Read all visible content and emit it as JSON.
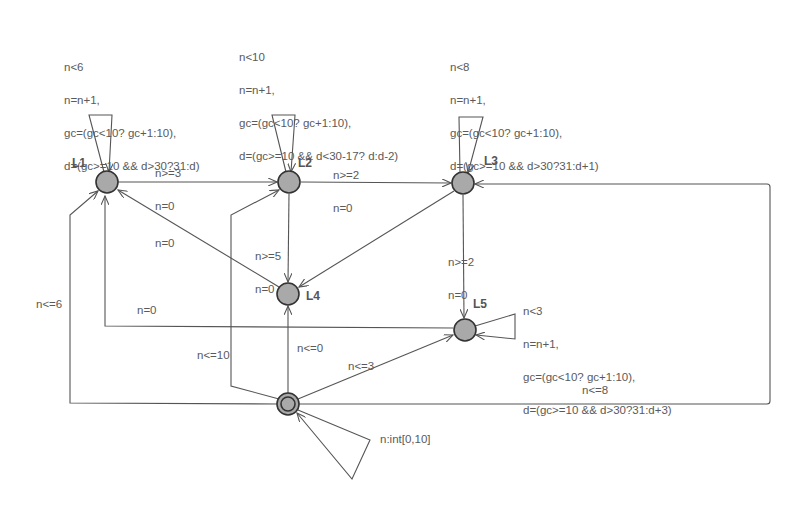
{
  "diagram": {
    "type": "timed-automaton",
    "colors": {
      "node_fill": "#a9a9a9",
      "node_stroke": "#333333",
      "edge": "#555555",
      "text": "#5a5a5a"
    },
    "nodes": [
      {
        "id": "L1",
        "label": "L1",
        "x": 107,
        "y": 182
      },
      {
        "id": "L2",
        "label": "L2",
        "x": 289,
        "y": 182
      },
      {
        "id": "L3",
        "label": "L3",
        "x": 463,
        "y": 183
      },
      {
        "id": "L4",
        "label": "L4",
        "x": 288,
        "y": 294
      },
      {
        "id": "L5",
        "label": "L5",
        "x": 465,
        "y": 330
      },
      {
        "id": "Init",
        "label": "",
        "x": 288,
        "y": 404,
        "initial": true
      }
    ],
    "self_loops": {
      "L1": [
        "n<6",
        "n=n+1,",
        "gc=(gc<10? gc+1:10),",
        "d=(gc>=10 && d>30?31:d)"
      ],
      "L2": [
        "n<10",
        "n=n+1,",
        "gc=(gc<10? gc+1:10),",
        "d=(gc>=10 && d<30-17? d:d-2)"
      ],
      "L3": [
        "n<8",
        "n=n+1,",
        "gc=(gc<10? gc+1:10),",
        "d=(gc>=10 && d>30?31:d+1)"
      ],
      "L5": [
        "n<3",
        "n=n+1,",
        "gc=(gc<10? gc+1:10),",
        "d=(gc>=10 && d>30?31:d+3)"
      ],
      "Init": [
        "n:int[0,10]"
      ]
    },
    "edges": [
      {
        "from": "L1",
        "to": "L2",
        "guard": "n>=3",
        "update": "n=0"
      },
      {
        "from": "L2",
        "to": "L3",
        "guard": "n>=2",
        "update": "n=0"
      },
      {
        "from": "L2",
        "to": "L4",
        "guard": "n>=5",
        "update": "n=0"
      },
      {
        "from": "L3",
        "to": "L4",
        "guard": "",
        "update": ""
      },
      {
        "from": "L3",
        "to": "L5",
        "guard": "n>=2",
        "update": "n=0"
      },
      {
        "from": "L4",
        "to": "L1",
        "guard": "",
        "update": "n=0"
      },
      {
        "from": "L5",
        "to": "L1",
        "guard": "",
        "update": "n=0"
      },
      {
        "from": "Init",
        "to": "L1",
        "guard": "n<=6",
        "update": ""
      },
      {
        "from": "Init",
        "to": "L2",
        "guard": "n<=10",
        "update": ""
      },
      {
        "from": "Init",
        "to": "L4",
        "guard": "n<=0",
        "update": ""
      },
      {
        "from": "Init",
        "to": "L5",
        "guard": "n<=3",
        "update": ""
      },
      {
        "from": "Init",
        "to": "L3",
        "guard": "n<=8",
        "update": ""
      }
    ]
  },
  "labels": {
    "e_L1_L2": [
      "n>=3",
      "n=0"
    ],
    "e_L2_L3": [
      "n>=2",
      "n=0"
    ],
    "e_L2_L4": [
      "n>=5",
      "n=0"
    ],
    "e_L3_L5": [
      "n>=2",
      "n=0"
    ],
    "e_L4_L1": "n=0",
    "e_L5_L1": "n=0",
    "e_I_L1": "n<=6",
    "e_I_L2": "n<=10",
    "e_I_L4": "n<=0",
    "e_I_L5": "n<=3",
    "e_I_L3": "n<=8"
  }
}
